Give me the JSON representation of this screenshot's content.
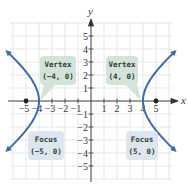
{
  "chart_data": {
    "type": "line",
    "title": "",
    "equation": "x^2/16 - y^2/9 = 1",
    "xlabel": "x",
    "ylabel": "y",
    "xlim": [
      -6,
      6
    ],
    "ylim": [
      -6,
      6
    ],
    "grid": true,
    "x_ticks": [
      "-5",
      "-4",
      "-3",
      "-2",
      "-1",
      "1",
      "2",
      "3",
      "4",
      "5"
    ],
    "y_ticks": [
      "5",
      "4",
      "3",
      "2",
      "1",
      "-1",
      "-2",
      "-3",
      "-4",
      "-5"
    ],
    "series": [
      {
        "name": "left-branch",
        "color": "#3f6aa8",
        "a": 4,
        "b": 3,
        "side": -1
      },
      {
        "name": "right-branch",
        "color": "#3f6aa8",
        "a": 4,
        "b": 3,
        "side": 1
      }
    ],
    "points": [
      {
        "name": "vertex-left",
        "x": -4,
        "y": 0
      },
      {
        "name": "vertex-right",
        "x": 4,
        "y": 0
      },
      {
        "name": "focus-left",
        "x": -5,
        "y": 0
      },
      {
        "name": "focus-right",
        "x": 5,
        "y": 0
      }
    ],
    "annotations": [
      {
        "id": "vertex_left",
        "line1": "Vertex",
        "line2": "(−4, 0)"
      },
      {
        "id": "vertex_right",
        "line1": "Vertex",
        "line2": "(4, 0)"
      },
      {
        "id": "focus_left",
        "line1": "Focus",
        "line2": "(−5, 0)"
      },
      {
        "id": "focus_right",
        "line1": "Focus",
        "line2": "(5, 0)"
      }
    ]
  },
  "labels": {
    "x_axis": "x",
    "y_axis": "y",
    "vertex_left_1": "Vertex",
    "vertex_left_2": "(−4, 0)",
    "vertex_right_1": "Vertex",
    "vertex_right_2": "(4, 0)",
    "focus_left_1": "Focus",
    "focus_left_2": "(−5, 0)",
    "focus_right_1": "Focus",
    "focus_right_2": "(5, 0)",
    "xt": [
      "−5",
      "−4",
      "−3",
      "−2",
      "−1",
      "1",
      "2",
      "3",
      "4",
      "5"
    ],
    "yt": [
      "5",
      "4",
      "3",
      "2",
      "1",
      "−1",
      "−2",
      "−3",
      "−4",
      "−5"
    ]
  },
  "colors": {
    "curve": "#3f6aa8",
    "grid": "#d9dde3",
    "axis": "#333333",
    "callout_bg": "#d3e3da",
    "point": "#222222"
  }
}
